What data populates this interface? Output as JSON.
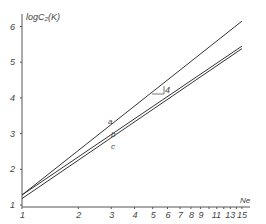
{
  "chart_data": {
    "type": "line",
    "title": "",
    "xlabel": "Ne",
    "ylabel": "logC2(K)",
    "xscale": "log",
    "xlim": [
      1,
      15
    ],
    "ylim": [
      1,
      6.3
    ],
    "grid": false,
    "legend": "none (inline line labels)",
    "x_ticks": [
      1,
      2,
      3,
      4,
      5,
      6,
      7,
      8,
      9,
      10,
      11,
      12,
      13,
      14,
      15
    ],
    "x_tick_labels": [
      "1",
      "2",
      "3",
      "4",
      "5",
      "6",
      "7",
      "8",
      "9",
      "11",
      "13",
      "15"
    ],
    "y_ticks": [
      1,
      2,
      3,
      4,
      5,
      6
    ],
    "y_tick_labels": [
      "1",
      "2",
      "3",
      "4",
      "5",
      "6"
    ],
    "series": [
      {
        "name": "a",
        "x": [
          1,
          15
        ],
        "y": [
          1.28,
          6.15
        ]
      },
      {
        "name": "b",
        "x": [
          1,
          15
        ],
        "y": [
          1.28,
          5.45
        ]
      },
      {
        "name": "c",
        "x": [
          1,
          15
        ],
        "y": [
          1.18,
          5.38
        ]
      }
    ],
    "annotations": [
      {
        "text": "4",
        "type": "slope-triangle",
        "x": 5.5,
        "y": 4.2
      }
    ]
  },
  "labels": {
    "ylabel": "logC₂(K)",
    "xlabel": "Ne",
    "a": "a",
    "b": "b",
    "c": "c",
    "slope": "4"
  }
}
